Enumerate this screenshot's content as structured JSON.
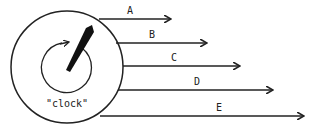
{
  "diagram": {
    "clock_label": "\"clock\"",
    "arrows": [
      {
        "label": "A",
        "y": 19,
        "x1": 99,
        "x2": 171,
        "lx": 127
      },
      {
        "label": "B",
        "y": 43,
        "x1": 116,
        "x2": 207,
        "lx": 149
      },
      {
        "label": "C",
        "y": 66,
        "x1": 123,
        "x2": 240,
        "lx": 171
      },
      {
        "label": "D",
        "y": 90,
        "x1": 118,
        "x2": 273,
        "lx": 194
      },
      {
        "label": "E",
        "y": 116,
        "x1": 100,
        "x2": 304,
        "lx": 216
      }
    ],
    "colors": {
      "stroke": "#222222",
      "background": "#ffffff"
    }
  }
}
